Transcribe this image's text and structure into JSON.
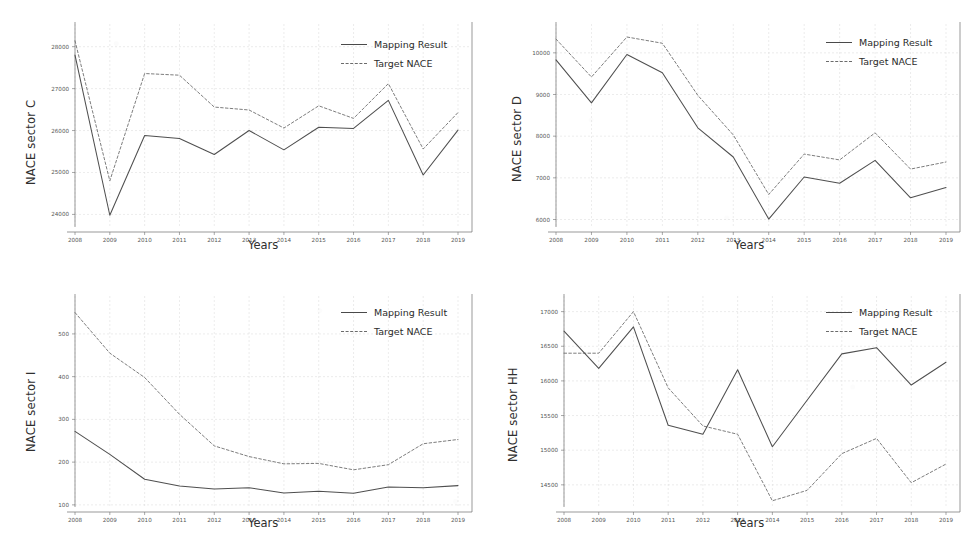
{
  "figure": {
    "panel_count": 4,
    "legend": {
      "mapping_label": "Mapping Result",
      "target_label": "Target NACE"
    },
    "colors": {
      "mapping_line": "#4f4f4f",
      "target_line": "#767676",
      "axis": "#6f6f6f",
      "grid": "#d9d9d9",
      "background": "#ffffff"
    }
  },
  "chart_data": [
    {
      "type": "line",
      "panel": "top-left",
      "title": "",
      "xlabel": "Years",
      "ylabel": "NACE sector C",
      "categories": [
        2008,
        2009,
        2010,
        2011,
        2012,
        2013,
        2014,
        2015,
        2016,
        2017,
        2018,
        2019
      ],
      "x_ticks": [
        "2008",
        "2009",
        "2010",
        "2011",
        "2012",
        "2013",
        "2014",
        "2015",
        "2016",
        "2017",
        "2018",
        "2019"
      ],
      "y_ticks": [
        "24000",
        "25000",
        "26000",
        "27000",
        "28000"
      ],
      "ylim": [
        23700,
        28350
      ],
      "grid": true,
      "legend_position": "upper right",
      "series": [
        {
          "name": "Mapping Result",
          "style": "solid",
          "values": [
            27800,
            23980,
            25880,
            25810,
            25430,
            26000,
            25540,
            26080,
            26050,
            26720,
            24940,
            26010
          ]
        },
        {
          "name": "Target NACE",
          "style": "dashed",
          "values": [
            28140,
            24800,
            27360,
            27320,
            26560,
            26490,
            26060,
            26590,
            26290,
            27120,
            25560,
            26430
          ]
        }
      ]
    },
    {
      "type": "line",
      "panel": "top-right",
      "title": "",
      "xlabel": "Years",
      "ylabel": "NACE sector D",
      "categories": [
        2008,
        2009,
        2010,
        2011,
        2012,
        2013,
        2014,
        2015,
        2016,
        2017,
        2018,
        2019
      ],
      "x_ticks": [
        "2008",
        "2009",
        "2010",
        "2011",
        "2012",
        "2013",
        "2014",
        "2015",
        "2016",
        "2017",
        "2018",
        "2019"
      ],
      "y_ticks": [
        "6000",
        "7000",
        "8000",
        "9000",
        "10000"
      ],
      "ylim": [
        5820,
        10500
      ],
      "grid": true,
      "legend_position": "upper right",
      "series": [
        {
          "name": "Mapping Result",
          "style": "solid",
          "values": [
            9830,
            8800,
            9960,
            9520,
            8200,
            7500,
            6010,
            7020,
            6870,
            7420,
            6520,
            6770
          ]
        },
        {
          "name": "Target NACE",
          "style": "dashed",
          "values": [
            10330,
            9420,
            10380,
            10230,
            8980,
            8030,
            6600,
            7570,
            7430,
            8080,
            7210,
            7380
          ]
        }
      ]
    },
    {
      "type": "line",
      "panel": "bottom-left",
      "title": "",
      "xlabel": "Years",
      "ylabel": "NACE sector I",
      "categories": [
        2008,
        2009,
        2010,
        2011,
        2012,
        2013,
        2014,
        2015,
        2016,
        2017,
        2018,
        2019
      ],
      "x_ticks": [
        "2008",
        "2009",
        "2010",
        "2011",
        "2012",
        "2013",
        "2014",
        "2015",
        "2016",
        "2017",
        "2018",
        "2019"
      ],
      "y_ticks": [
        "100",
        "200",
        "300",
        "400",
        "500"
      ],
      "ylim": [
        95,
        570
      ],
      "grid": true,
      "legend_position": "upper right",
      "series": [
        {
          "name": "Mapping Result",
          "style": "solid",
          "values": [
            272,
            218,
            160,
            144,
            137,
            140,
            128,
            132,
            127,
            142,
            140,
            145
          ]
        },
        {
          "name": "Target NACE",
          "style": "dashed",
          "values": [
            550,
            455,
            398,
            312,
            238,
            213,
            196,
            197,
            182,
            194,
            243,
            253
          ]
        }
      ]
    },
    {
      "type": "line",
      "panel": "bottom-right",
      "title": "",
      "xlabel": "Years",
      "ylabel": "NACE sector HH",
      "categories": [
        2008,
        2009,
        2010,
        2011,
        2012,
        2013,
        2014,
        2015,
        2016,
        2017,
        2018,
        2019
      ],
      "x_ticks": [
        "2008",
        "2009",
        "2010",
        "2011",
        "2012",
        "2013",
        "2014",
        "2015",
        "2016",
        "2017",
        "2018",
        "2019"
      ],
      "y_ticks": [
        "14500",
        "15000",
        "15500",
        "16000",
        "16500",
        "17000"
      ],
      "ylim": [
        14180,
        17110
      ],
      "grid": true,
      "legend_position": "upper right",
      "series": [
        {
          "name": "Mapping Result",
          "style": "solid",
          "values": [
            16720,
            16180,
            16780,
            15360,
            15230,
            16160,
            15050,
            15720,
            16390,
            16480,
            15940,
            16270
          ]
        },
        {
          "name": "Target NACE",
          "style": "dashed",
          "values": [
            16400,
            16400,
            17000,
            15900,
            15350,
            15230,
            14270,
            14420,
            14950,
            15170,
            14530,
            14800
          ]
        }
      ]
    }
  ]
}
